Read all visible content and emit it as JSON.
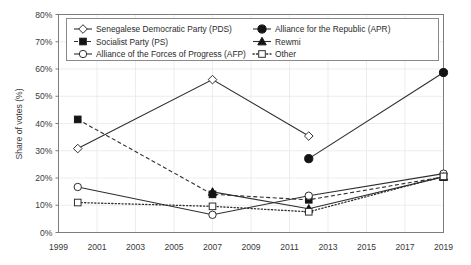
{
  "chart_data": {
    "type": "line",
    "title": "",
    "xlabel": "",
    "ylabel": "Share of votes (%)",
    "xlim": [
      1999,
      2019
    ],
    "ylim": [
      0,
      80
    ],
    "grid": true,
    "legend_position": "top-inside",
    "x_ticks": [
      "1999",
      "2001",
      "2003",
      "2005",
      "2007",
      "2009",
      "2011",
      "2013",
      "2015",
      "2017",
      "2019"
    ],
    "y_ticks": [
      "0%",
      "10%",
      "20%",
      "30%",
      "40%",
      "50%",
      "60%",
      "70%",
      "80%"
    ],
    "x": [
      2000,
      2007,
      2012,
      2019
    ],
    "series": [
      {
        "name": "Senegalese Democratic Party (PDS)",
        "key": "pds",
        "marker": "diamond-open",
        "line_style": "solid",
        "x": [
          2000,
          2007,
          2012
        ],
        "values": [
          30.8,
          56.1,
          35.4
        ]
      },
      {
        "name": "Socialist Party (PS)",
        "key": "ps",
        "marker": "square-filled",
        "line_style": "dashed",
        "x": [
          2000,
          2007,
          2012,
          2019
        ],
        "values": [
          41.5,
          14.0,
          12.0,
          20.4
        ]
      },
      {
        "name": "Alliance of the Forces of Progress (AFP)",
        "key": "afp",
        "marker": "circle-open",
        "line_style": "solid",
        "x": [
          2000,
          2007,
          2012,
          2019
        ],
        "values": [
          16.7,
          6.5,
          13.5,
          21.6
        ]
      },
      {
        "name": "Alliance for the Republic (APR)",
        "key": "apr",
        "marker": "circle-filled",
        "line_style": "solid",
        "x": [
          2012,
          2019
        ],
        "values": [
          27.1,
          58.7
        ]
      },
      {
        "name": "Rewmi",
        "key": "rewmi",
        "marker": "triangle-filled",
        "line_style": "solid",
        "x": [
          2007,
          2012,
          2019
        ],
        "values": [
          14.9,
          8.7,
          20.4
        ]
      },
      {
        "name": "Other",
        "key": "other",
        "marker": "square-open",
        "line_style": "dotted",
        "x": [
          2000,
          2007,
          2012,
          2019
        ],
        "values": [
          11.0,
          9.6,
          7.6,
          20.6
        ]
      }
    ]
  },
  "legend": {
    "entries": [
      {
        "label": "Senegalese Democratic Party (PDS)",
        "key": "pds"
      },
      {
        "label": "Socialist Party (PS)",
        "key": "ps"
      },
      {
        "label": "Alliance of the Forces of Progress (AFP)",
        "key": "afp"
      },
      {
        "label": "Alliance for the Republic (APR)",
        "key": "apr"
      },
      {
        "label": "Rewmi",
        "key": "rewmi"
      },
      {
        "label": "Other",
        "key": "other"
      }
    ]
  },
  "colors": {
    "line": "#2e2e2e",
    "marker_fill": "#141414",
    "marker_open": "#ffffff",
    "grid": "#e9e9e9",
    "frame": "#7d7d7d",
    "text": "#3a3a3a",
    "background": "#ffffff"
  }
}
